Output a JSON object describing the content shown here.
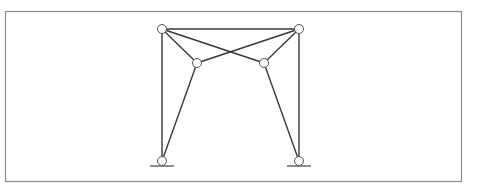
{
  "diagram": {
    "type": "truss-frame",
    "frame": {
      "x": 5,
      "y": 11,
      "width": 456,
      "height": 170,
      "stroke": "#8a8a8a"
    },
    "style": {
      "member_stroke": "#3a3a3a",
      "member_width": 1.4,
      "node_radius": 4.5,
      "node_fill": "#ffffff",
      "node_stroke": "#555555"
    },
    "nodes": [
      {
        "id": "A",
        "label": "top-left-joint",
        "x": 162,
        "y": 29
      },
      {
        "id": "B",
        "label": "top-right-joint",
        "x": 299,
        "y": 29
      },
      {
        "id": "C",
        "label": "inner-left-joint",
        "x": 197,
        "y": 63
      },
      {
        "id": "D",
        "label": "inner-right-joint",
        "x": 264,
        "y": 63
      },
      {
        "id": "E",
        "label": "left-support",
        "x": 162,
        "y": 161
      },
      {
        "id": "F",
        "label": "right-support",
        "x": 299,
        "y": 161
      }
    ],
    "members": [
      [
        "A",
        "B"
      ],
      [
        "A",
        "E"
      ],
      [
        "B",
        "F"
      ],
      [
        "A",
        "C"
      ],
      [
        "A",
        "D"
      ],
      [
        "B",
        "C"
      ],
      [
        "B",
        "D"
      ],
      [
        "C",
        "E"
      ],
      [
        "D",
        "F"
      ]
    ],
    "supports": [
      {
        "node": "E",
        "ground_x1": 150,
        "ground_x2": 174,
        "ground_y": 166
      },
      {
        "node": "F",
        "ground_x1": 287,
        "ground_x2": 311,
        "ground_y": 166
      }
    ]
  }
}
